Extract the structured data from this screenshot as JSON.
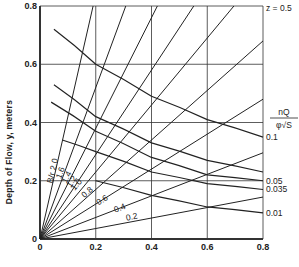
{
  "chart_data": {
    "type": "line",
    "title": "",
    "xlabel": "",
    "ylabel": "Depth of Flow, y, meters",
    "xlim": [
      0,
      0.8
    ],
    "ylim": [
      0,
      0.8
    ],
    "grid": true,
    "x_ticks": [
      "0",
      "0.2",
      "0.4",
      "0.6",
      "0.8"
    ],
    "y_ticks": [
      "0",
      "0.2",
      "0.4",
      "0.6",
      "0.8"
    ],
    "z_label": "z = 0.5",
    "parameter_label_numerator": "nQ",
    "parameter_label_denominator": "φ√S",
    "ratio_family": {
      "label_prefix": "B/r",
      "description": "Straight lines from origin, one per B/r ratio",
      "series": [
        {
          "name": "B/r 2.0",
          "label": "B/r 2.0",
          "slope_y_per_x": 4.2
        },
        {
          "name": "1.6",
          "label": "1.6",
          "slope_y_per_x": 2.6
        },
        {
          "name": "1.4",
          "label": "1.4",
          "slope_y_per_x": 1.9
        },
        {
          "name": "1.2",
          "label": "1.2",
          "slope_y_per_x": 1.45
        },
        {
          "name": "1.0",
          "label": "1.0",
          "slope_y_per_x": 1.15
        },
        {
          "name": "0.8",
          "label": "0.8",
          "slope_y_per_x": 0.85
        },
        {
          "name": "0.6",
          "label": "0.6",
          "slope_y_per_x": 0.6
        },
        {
          "name": "0.4",
          "label": "0.4",
          "slope_y_per_x": 0.37
        },
        {
          "name": "0.2",
          "label": "0.2",
          "slope_y_per_x": 0.18
        }
      ]
    },
    "parameter_family": {
      "description": "Descending curves labelled by nQ/(φ√S)",
      "series": [
        {
          "name": "0.1 (top)",
          "label": "",
          "x": [
            0.05,
            0.2,
            0.4,
            0.6,
            0.8
          ],
          "y": [
            0.72,
            0.6,
            0.49,
            0.41,
            0.35
          ]
        },
        {
          "name": "0.1",
          "label": "0.1",
          "x": [
            0.05,
            0.2,
            0.4,
            0.6,
            0.8
          ],
          "y": [
            0.53,
            0.42,
            0.33,
            0.27,
            0.23
          ]
        },
        {
          "name": "0.05",
          "label": "0.05",
          "x": [
            0.04,
            0.2,
            0.4,
            0.6,
            0.8
          ],
          "y": [
            0.47,
            0.37,
            0.28,
            0.22,
            0.2
          ]
        },
        {
          "name": "0.035",
          "label": "0.035",
          "x": [
            0.08,
            0.2,
            0.4,
            0.6,
            0.8
          ],
          "y": [
            0.34,
            0.3,
            0.23,
            0.19,
            0.17
          ]
        },
        {
          "name": "0.01",
          "label": "0.01",
          "x": [
            0.2,
            0.4,
            0.6,
            0.8
          ],
          "y": [
            0.2,
            0.15,
            0.11,
            0.09
          ]
        }
      ]
    },
    "right_labels": [
      {
        "text": "z = 0.5",
        "y": 0.8
      },
      {
        "text": "0.1",
        "y": 0.35
      },
      {
        "text": "0.05",
        "y": 0.2
      },
      {
        "text": "0.035",
        "y": 0.17
      },
      {
        "text": "0.01",
        "y": 0.09
      }
    ]
  }
}
